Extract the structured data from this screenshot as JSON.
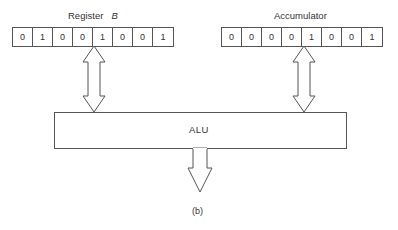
{
  "figure": {
    "caption": "(b)",
    "registers": [
      {
        "id": "register-b",
        "label": "Register",
        "label_var": "B",
        "bits": [
          "0",
          "1",
          "0",
          "0",
          "1",
          "0",
          "0",
          "1"
        ]
      },
      {
        "id": "accumulator",
        "label": "Accumulator",
        "bits": [
          "0",
          "0",
          "0",
          "0",
          "1",
          "0",
          "0",
          "1"
        ]
      }
    ],
    "alu": {
      "label": "ALU"
    },
    "arrows": [
      {
        "from": "Register B",
        "to": "ALU",
        "type": "bidirectional"
      },
      {
        "from": "Accumulator",
        "to": "ALU",
        "type": "bidirectional"
      },
      {
        "from": "ALU",
        "to": "output",
        "type": "down"
      }
    ],
    "colors": {
      "stroke": "#555555",
      "text": "#333333",
      "background": "#ffffff"
    }
  }
}
